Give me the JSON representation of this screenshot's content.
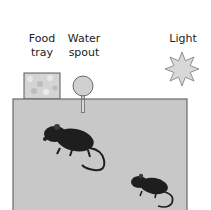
{
  "labels": {
    "food": "Food\ntray",
    "water": "Water\nspout",
    "light": "Light"
  },
  "colors": {
    "cage_fill": "#c8c8c8",
    "cage_stroke": "#6a6a6a",
    "tray_fill": "#d6d6d6",
    "water_fill": "#d0d0d0",
    "sun_fill": "#d8d8d8",
    "mouse": "#1e1e1e"
  },
  "icons": [
    "food-tray-icon",
    "water-spout-icon",
    "light-sun-icon",
    "mouse-icon",
    "mouse-icon"
  ]
}
